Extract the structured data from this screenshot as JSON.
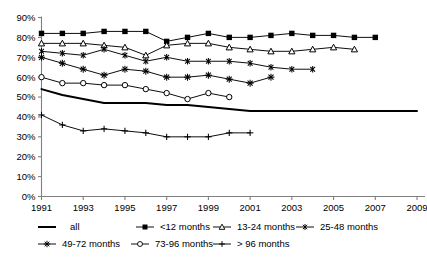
{
  "chart_data": {
    "type": "line",
    "title": "",
    "subtitle": "",
    "xlabel": "",
    "ylabel": "",
    "grid": false,
    "legend_position": "bottom",
    "x": [
      1991,
      1992,
      1993,
      1994,
      1995,
      1996,
      1997,
      1998,
      1999,
      2000,
      2001,
      2002,
      2003,
      2004,
      2005,
      2006,
      2007,
      2008,
      2009
    ],
    "xlim": [
      1991,
      2009
    ],
    "xticks": [
      1991,
      1993,
      1995,
      1997,
      1999,
      2001,
      2003,
      2005,
      2007,
      2009
    ],
    "xtick_labels": [
      "1991",
      "1993",
      "1995",
      "1997",
      "1999",
      "2001",
      "2003",
      "2005",
      "2007",
      "2009"
    ],
    "ylim": [
      0,
      90
    ],
    "yticks": [
      0,
      10,
      20,
      30,
      40,
      50,
      60,
      70,
      80,
      90
    ],
    "ytick_labels": [
      "0%",
      "10%",
      "20%",
      "30%",
      "40%",
      "50%",
      "60%",
      "70%",
      "80%",
      "90%"
    ],
    "series": [
      {
        "name": "all",
        "marker": "none",
        "x": [
          1991,
          1992,
          1993,
          1994,
          1995,
          1996,
          1997,
          1998,
          1999,
          2000,
          2001,
          2002,
          2003,
          2004,
          2005,
          2006,
          2007,
          2008,
          2009
        ],
        "values": [
          54,
          51,
          49,
          47,
          47,
          47,
          46,
          46,
          45,
          44,
          43,
          43,
          43,
          43,
          43,
          43,
          43,
          43,
          43
        ]
      },
      {
        "name": "<12 months",
        "marker": "filled-square",
        "x": [
          1991,
          1992,
          1993,
          1994,
          1995,
          1996,
          1997,
          1998,
          1999,
          2000,
          2001,
          2002,
          2003,
          2004,
          2005,
          2006,
          2007
        ],
        "values": [
          82,
          82,
          82,
          83,
          83,
          83,
          78,
          80,
          82,
          80,
          80,
          81,
          82,
          81,
          81,
          80,
          80
        ]
      },
      {
        "name": "13-24 months",
        "marker": "open-triangle",
        "x": [
          1991,
          1992,
          1993,
          1994,
          1995,
          1996,
          1997,
          1998,
          1999,
          2000,
          2001,
          2002,
          2003,
          2004,
          2005,
          2006
        ],
        "values": [
          77,
          77,
          77,
          76,
          75,
          71,
          76,
          77,
          77,
          75,
          74,
          73,
          73,
          74,
          75,
          74
        ]
      },
      {
        "name": "25-48 months",
        "marker": "asterisk",
        "x": [
          1991,
          1992,
          1993,
          1994,
          1995,
          1996,
          1997,
          1998,
          1999,
          2000,
          2001,
          2002,
          2003,
          2004
        ],
        "values": [
          73,
          72,
          71,
          74,
          71,
          68,
          70,
          68,
          68,
          68,
          67,
          65,
          64,
          64
        ]
      },
      {
        "name": "49-72 months",
        "marker": "star",
        "x": [
          1991,
          1992,
          1993,
          1994,
          1995,
          1996,
          1997,
          1998,
          1999,
          2000,
          2001,
          2002
        ],
        "values": [
          70,
          67,
          64,
          61,
          64,
          63,
          60,
          60,
          61,
          59,
          57,
          60
        ]
      },
      {
        "name": "73-96 months",
        "marker": "open-circle",
        "x": [
          1991,
          1992,
          1993,
          1994,
          1995,
          1996,
          1997,
          1998,
          1999,
          2000
        ],
        "values": [
          60,
          57,
          57,
          56,
          56,
          54,
          52,
          49,
          52,
          50
        ]
      },
      {
        "name": "> 96 months",
        "marker": "plus",
        "x": [
          1991,
          1992,
          1993,
          1994,
          1995,
          1996,
          1997,
          1998,
          1999,
          2000,
          2001
        ],
        "values": [
          41,
          36,
          33,
          34,
          33,
          32,
          30,
          30,
          30,
          32,
          32
        ]
      }
    ]
  },
  "legend": {
    "entries": [
      {
        "label": "all",
        "marker": "none"
      },
      {
        "label": "<12 months",
        "marker": "filled-square"
      },
      {
        "label": "13-24 months",
        "marker": "open-triangle"
      },
      {
        "label": "25-48 months",
        "marker": "asterisk"
      },
      {
        "label": "49-72 months",
        "marker": "star"
      },
      {
        "label": "73-96 months",
        "marker": "open-circle"
      },
      {
        "label": "> 96 months",
        "marker": "plus"
      }
    ]
  },
  "colors": {
    "line": "#000000",
    "axis": "#808080",
    "text": "#000000",
    "background": "#ffffff"
  }
}
